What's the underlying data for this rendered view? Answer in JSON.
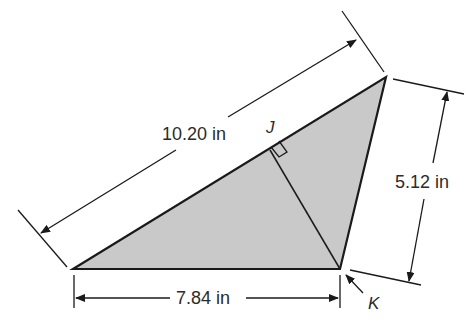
{
  "diagram": {
    "type": "triangle-dimension-drawing",
    "colors": {
      "fill": "#c9c9c9",
      "stroke": "#1a1a1a",
      "text": "#2b2b2b"
    },
    "labels": {
      "hypotenuse": "10.20 in",
      "base": "7.84 in",
      "side": "5.12 in",
      "altitude_foot": "J",
      "vertex": "K"
    }
  }
}
